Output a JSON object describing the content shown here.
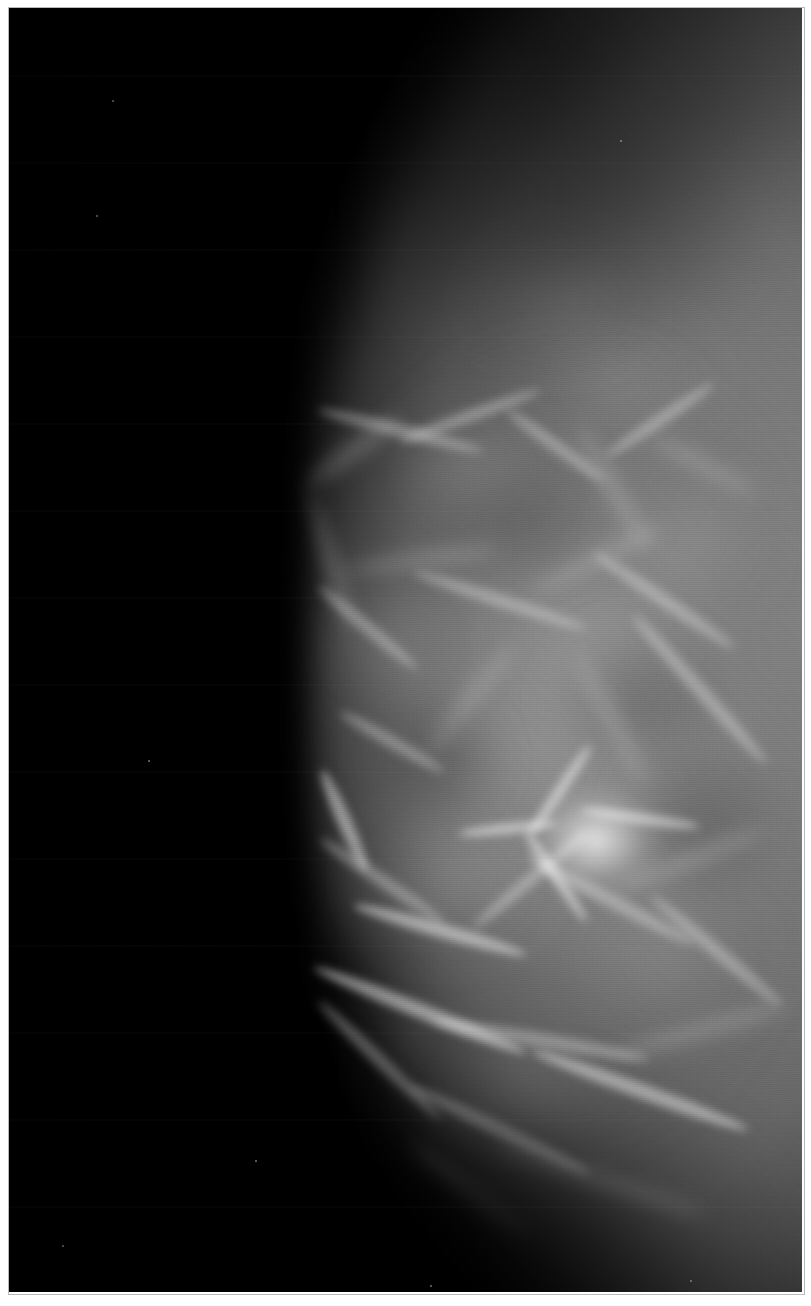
{
  "document": {
    "kind": "medical-radiograph",
    "modality_label": "Mammogram",
    "view_label": "Craniocaudal (CC)",
    "laterality_label": "Right",
    "caption": "",
    "visible_text": []
  },
  "canvas": {
    "width_px": 811,
    "height_px": 1306,
    "paper_color": "#ffffff",
    "border_px": 8,
    "plate": {
      "left_px": 9,
      "top_px": 8,
      "width_px": 793,
      "height_px": 1284,
      "background_color": "#000000",
      "bevel_color": "#b9b9b9"
    }
  },
  "palette": {
    "air_black": "#000000",
    "skin_edge": "#3a3a3a",
    "subcutaneous_fat": "#5a5a5a",
    "parenchyma_mid": "#6e6e6e",
    "parenchyma_bright": "#9a9a9a",
    "fibrous_strand": "#cfcfcf",
    "hub_highlight": "#f6f6f6",
    "paper_white": "#ffffff"
  },
  "anatomy": {
    "orientation_note": "Breast occupies the right side; chest wall at right margin; nipple points left.",
    "regions": [
      {
        "name": "air-background",
        "description": "Black un-exposed field, left third and corners."
      },
      {
        "name": "skin-line",
        "description": "Convex anterior border sweeping from upper-right to nipple apex and back down."
      },
      {
        "name": "subcutaneous-fat",
        "description": "Darker grey rim just inside the skin line."
      },
      {
        "name": "fibroglandular-tissue",
        "description": "Mid-grey mottled parenchyma filling the central breast."
      },
      {
        "name": "coopers-ligaments",
        "description": "Thin bright curvilinear strands crossing the lower half."
      },
      {
        "name": "retroareolar-hub",
        "description": "Bright radiating stellate convergence of ducts behind the nipple."
      },
      {
        "name": "chest-wall-margin",
        "description": "Tissue continues off the right edge of the plate."
      }
    ],
    "skin_line_points": [
      {
        "x": 648,
        "y": 62
      },
      {
        "x": 540,
        "y": 150
      },
      {
        "x": 440,
        "y": 270
      },
      {
        "x": 360,
        "y": 400
      },
      {
        "x": 312,
        "y": 520
      },
      {
        "x": 292,
        "y": 645
      },
      {
        "x": 306,
        "y": 780
      },
      {
        "x": 352,
        "y": 920
      },
      {
        "x": 430,
        "y": 1055
      },
      {
        "x": 530,
        "y": 1170
      },
      {
        "x": 640,
        "y": 1265
      }
    ],
    "nipple_apex": {
      "x": 292,
      "y": 645
    },
    "retroareolar_hub": {
      "x": 588,
      "y": 830,
      "radius_px": 72
    }
  },
  "texture": {
    "grain_opacity": 0.16,
    "scanline_period_px": 87,
    "vignette": true
  },
  "strands": [
    {
      "x": 352,
      "y": 452,
      "w": 120,
      "h": 16,
      "rot": -36,
      "cls": "strand soft"
    },
    {
      "x": 400,
      "y": 430,
      "w": 170,
      "h": 13,
      "rot": 14,
      "cls": "strand"
    },
    {
      "x": 470,
      "y": 416,
      "w": 150,
      "h": 12,
      "rot": -20,
      "cls": "strand"
    },
    {
      "x": 556,
      "y": 446,
      "w": 120,
      "h": 12,
      "rot": 36,
      "cls": "strand"
    },
    {
      "x": 612,
      "y": 486,
      "w": 140,
      "h": 14,
      "rot": 60,
      "cls": "strand soft"
    },
    {
      "x": 660,
      "y": 420,
      "w": 130,
      "h": 12,
      "rot": -34,
      "cls": "strand"
    },
    {
      "x": 704,
      "y": 466,
      "w": 120,
      "h": 12,
      "rot": 28,
      "cls": "strand soft"
    },
    {
      "x": 330,
      "y": 560,
      "w": 150,
      "h": 14,
      "rot": 72,
      "cls": "strand soft"
    },
    {
      "x": 368,
      "y": 628,
      "w": 130,
      "h": 12,
      "rot": 40,
      "cls": "strand"
    },
    {
      "x": 420,
      "y": 560,
      "w": 160,
      "h": 12,
      "rot": -8,
      "cls": "strand soft"
    },
    {
      "x": 500,
      "y": 600,
      "w": 180,
      "h": 13,
      "rot": 18,
      "cls": "strand"
    },
    {
      "x": 596,
      "y": 560,
      "w": 150,
      "h": 12,
      "rot": -26,
      "cls": "strand soft"
    },
    {
      "x": 664,
      "y": 600,
      "w": 170,
      "h": 13,
      "rot": 34,
      "cls": "strand"
    },
    {
      "x": 700,
      "y": 690,
      "w": 200,
      "h": 14,
      "rot": 48,
      "cls": "strand"
    },
    {
      "x": 612,
      "y": 720,
      "w": 150,
      "h": 12,
      "rot": 62,
      "cls": "strand soft"
    },
    {
      "x": 470,
      "y": 700,
      "w": 140,
      "h": 12,
      "rot": -52,
      "cls": "strand soft"
    },
    {
      "x": 392,
      "y": 742,
      "w": 120,
      "h": 12,
      "rot": 30,
      "cls": "strand"
    },
    {
      "x": 344,
      "y": 820,
      "w": 110,
      "h": 14,
      "rot": 66,
      "cls": "strand bright"
    },
    {
      "x": 382,
      "y": 880,
      "w": 150,
      "h": 13,
      "rot": 34,
      "cls": "strand"
    },
    {
      "x": 440,
      "y": 930,
      "w": 180,
      "h": 14,
      "rot": 16,
      "cls": "strand bright"
    },
    {
      "x": 530,
      "y": 880,
      "w": 150,
      "h": 12,
      "rot": -40,
      "cls": "strand"
    },
    {
      "x": 610,
      "y": 900,
      "w": 190,
      "h": 14,
      "rot": 28,
      "cls": "strand"
    },
    {
      "x": 690,
      "y": 860,
      "w": 160,
      "h": 13,
      "rot": -22,
      "cls": "strand soft"
    },
    {
      "x": 716,
      "y": 950,
      "w": 170,
      "h": 13,
      "rot": 40,
      "cls": "strand"
    },
    {
      "x": 420,
      "y": 1010,
      "w": 230,
      "h": 15,
      "rot": 22,
      "cls": "strand bright"
    },
    {
      "x": 380,
      "y": 1060,
      "w": 170,
      "h": 13,
      "rot": 44,
      "cls": "strand"
    },
    {
      "x": 540,
      "y": 1040,
      "w": 220,
      "h": 14,
      "rot": 10,
      "cls": "strand"
    },
    {
      "x": 640,
      "y": 1090,
      "w": 230,
      "h": 15,
      "rot": 20,
      "cls": "strand bright"
    },
    {
      "x": 700,
      "y": 1030,
      "w": 180,
      "h": 13,
      "rot": -16,
      "cls": "strand soft"
    },
    {
      "x": 500,
      "y": 1130,
      "w": 200,
      "h": 14,
      "rot": 26,
      "cls": "strand"
    },
    {
      "x": 600,
      "y": 1180,
      "w": 220,
      "h": 14,
      "rot": 18,
      "cls": "strand soft"
    },
    {
      "x": 470,
      "y": 1190,
      "w": 150,
      "h": 12,
      "rot": 38,
      "cls": "strand soft"
    },
    {
      "x": 560,
      "y": 790,
      "w": 110,
      "h": 11,
      "rot": -56,
      "cls": "strand bright"
    },
    {
      "x": 556,
      "y": 876,
      "w": 110,
      "h": 11,
      "rot": 56,
      "cls": "strand bright"
    },
    {
      "x": 640,
      "y": 818,
      "w": 120,
      "h": 11,
      "rot": 8,
      "cls": "strand bright"
    },
    {
      "x": 508,
      "y": 828,
      "w": 100,
      "h": 11,
      "rot": -6,
      "cls": "strand bright"
    }
  ],
  "blobs": [
    {
      "x": 470,
      "y": 470,
      "w": 170,
      "h": 130,
      "a": 0.16,
      "cls": "blob"
    },
    {
      "x": 620,
      "y": 380,
      "w": 190,
      "h": 150,
      "a": 0.12,
      "cls": "blob"
    },
    {
      "x": 380,
      "y": 640,
      "w": 160,
      "h": 150,
      "a": 0.14,
      "cls": "blob"
    },
    {
      "x": 600,
      "y": 640,
      "w": 210,
      "h": 170,
      "a": 0.1,
      "cls": "blob"
    },
    {
      "x": 690,
      "y": 540,
      "w": 170,
      "h": 150,
      "a": 0.13,
      "cls": "blob"
    },
    {
      "x": 450,
      "y": 880,
      "w": 200,
      "h": 160,
      "a": 0.14,
      "cls": "blob"
    },
    {
      "x": 660,
      "y": 960,
      "w": 210,
      "h": 170,
      "a": 0.12,
      "cls": "blob"
    },
    {
      "x": 520,
      "y": 1090,
      "w": 220,
      "h": 150,
      "a": 0.13,
      "cls": "blob"
    },
    {
      "x": 560,
      "y": 300,
      "w": 180,
      "h": 140,
      "a": 0.1,
      "cls": "blob"
    },
    {
      "x": 430,
      "y": 760,
      "w": 150,
      "h": 140,
      "a": 0.3,
      "cls": "blob dark"
    },
    {
      "x": 640,
      "y": 700,
      "w": 190,
      "h": 160,
      "a": 0.26,
      "cls": "blob dark"
    },
    {
      "x": 700,
      "y": 820,
      "w": 170,
      "h": 170,
      "a": 0.24,
      "cls": "blob dark"
    },
    {
      "x": 520,
      "y": 520,
      "w": 180,
      "h": 150,
      "a": 0.22,
      "cls": "blob dark"
    },
    {
      "x": 350,
      "y": 980,
      "w": 160,
      "h": 150,
      "a": 0.34,
      "cls": "blob dark"
    }
  ],
  "specks": [
    {
      "x": 112,
      "y": 100
    },
    {
      "x": 96,
      "y": 215
    },
    {
      "x": 148,
      "y": 760
    },
    {
      "x": 255,
      "y": 1160
    },
    {
      "x": 62,
      "y": 1245
    },
    {
      "x": 430,
      "y": 1285
    },
    {
      "x": 690,
      "y": 1280
    },
    {
      "x": 620,
      "y": 140
    }
  ]
}
